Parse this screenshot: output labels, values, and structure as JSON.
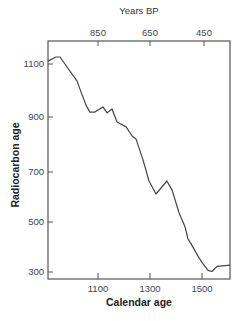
{
  "chart_data": {
    "type": "line",
    "title": "",
    "xlabel": "Calendar age",
    "ylabel": "Radiocarbon age",
    "top_xlabel": "Years BP",
    "xlim": [
      908,
      1610
    ],
    "ylim": [
      280,
      1135
    ],
    "x_ticks": [
      1100,
      1300,
      1500
    ],
    "y_ticks": [
      300,
      500,
      700,
      900,
      1100
    ],
    "top_x_ticks": [
      850,
      650,
      450
    ],
    "grid": false,
    "legend": null,
    "series": [
      {
        "name": "Calibration curve",
        "color": "#444444",
        "x": [
          908,
          938,
          954,
          1019,
          1054,
          1069,
          1088,
          1119,
          1135,
          1154,
          1173,
          1208,
          1231,
          1246,
          1273,
          1296,
          1323,
          1365,
          1385,
          1412,
          1435,
          1446,
          1458,
          1485,
          1500,
          1523,
          1538,
          1558,
          1608
        ],
        "y": [
          1111,
          1127,
          1127,
          1035,
          942,
          915,
          915,
          935,
          912,
          927,
          877,
          858,
          823,
          812,
          731,
          650,
          600,
          650,
          615,
          527,
          473,
          427,
          408,
          360,
          337,
          306,
          302,
          322,
          326
        ]
      }
    ]
  },
  "labels": {
    "top_title": "Years BP",
    "x_title": "Calendar age",
    "y_title": "Radiocarbon age",
    "x_tick_labels": [
      "1100",
      "1300",
      "1500"
    ],
    "y_tick_labels": [
      "1100",
      "900",
      "700",
      "500",
      "300"
    ],
    "top_tick_labels": [
      "850",
      "650",
      "450"
    ]
  }
}
